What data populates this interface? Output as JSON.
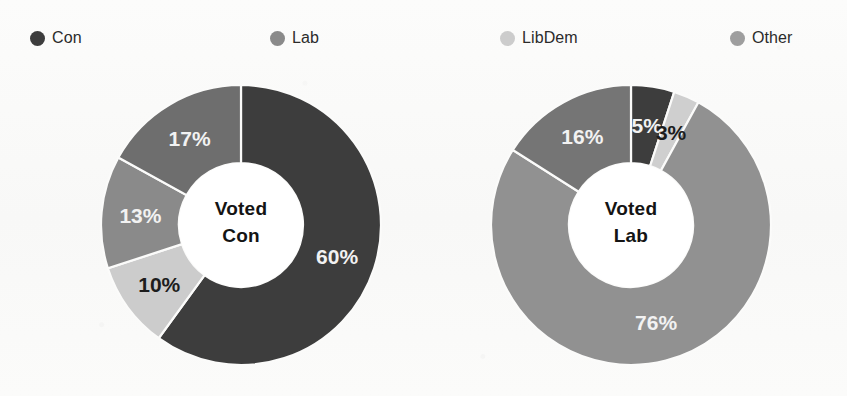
{
  "legend": {
    "items": [
      {
        "label": "Con",
        "color": "#3d3d3d",
        "x": 30
      },
      {
        "label": "Lab",
        "color": "#8a8a8a",
        "x": 270
      },
      {
        "label": "LibDem",
        "color": "#cccccc",
        "x": 500
      },
      {
        "label": "Other",
        "color": "#9e9e9e",
        "x": 730
      }
    ]
  },
  "chart_data": [
    {
      "type": "pie",
      "variant": "donut",
      "title": "Voted Con",
      "center_label_line1": "Voted",
      "center_label_line2": "Con",
      "start_angle_deg": 0,
      "direction": "clockwise",
      "categories": [
        "Con",
        "LibDem",
        "Lab",
        "Other"
      ],
      "values": [
        60,
        10,
        13,
        17
      ],
      "value_labels": [
        "60%",
        "10%",
        "13%",
        "17%"
      ],
      "colors": [
        "#3d3d3d",
        "#cccccc",
        "#8a8a8a",
        "#6e6e6e"
      ],
      "label_text_tone": [
        "light",
        "dark",
        "light",
        "light"
      ],
      "legend_position": "top"
    },
    {
      "type": "pie",
      "variant": "donut",
      "title": "Voted Lab",
      "center_label_line1": "Voted",
      "center_label_line2": "Lab",
      "start_angle_deg": 0,
      "direction": "clockwise",
      "categories": [
        "Con",
        "LibDem",
        "Lab",
        "Other"
      ],
      "values": [
        5,
        3,
        76,
        16
      ],
      "value_labels": [
        "5%",
        "3%",
        "76%",
        "16%"
      ],
      "colors": [
        "#3d3d3d",
        "#cfcfcf",
        "#919191",
        "#757575"
      ],
      "label_text_tone": [
        "light",
        "dark",
        "light",
        "light"
      ],
      "legend_position": "top"
    }
  ],
  "geometry": {
    "outer_radius": 140,
    "inner_radius": 62,
    "label_radius": 101
  }
}
